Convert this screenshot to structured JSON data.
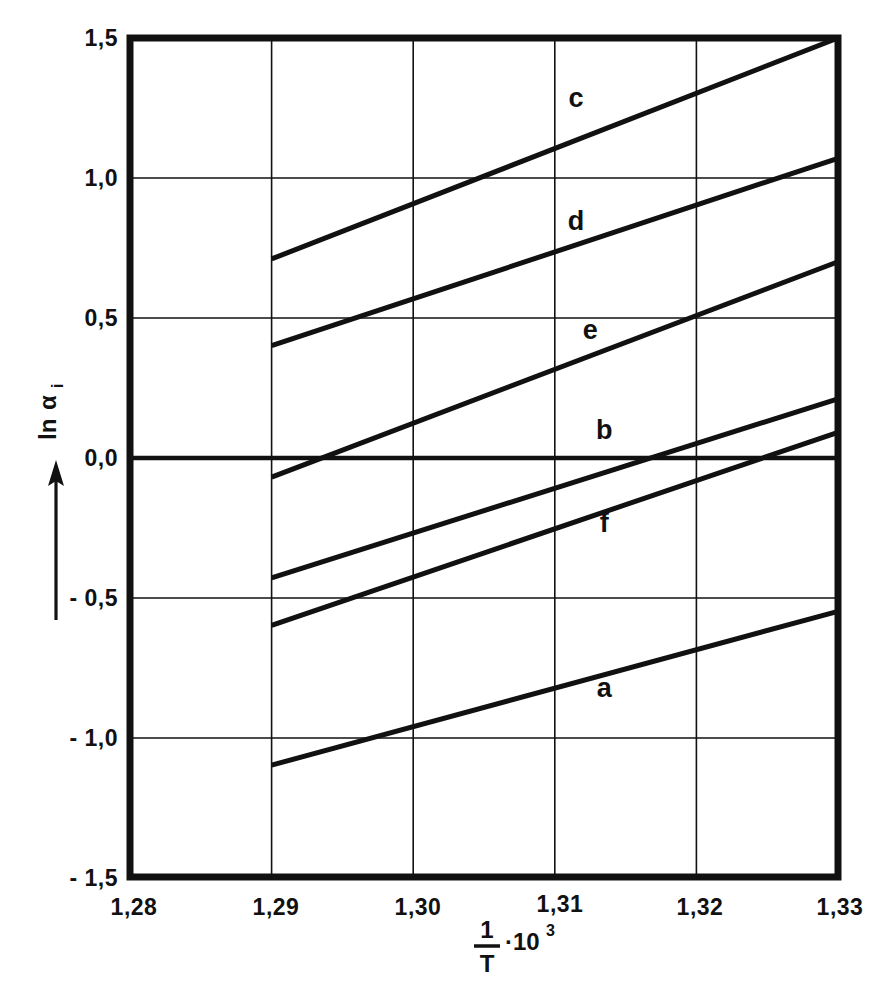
{
  "chart_data": {
    "type": "line",
    "title": "",
    "subtitle": "",
    "xlabel": "1/T · 10³",
    "xlabel_parts": {
      "numerator": "1",
      "denominator": "T",
      "multiplier": "·10",
      "exponent": "3"
    },
    "ylabel": "ln α i",
    "ylabel_parts": {
      "prefix": "ln",
      "symbol": "α",
      "subscript": "i"
    },
    "xlim": [
      1.28,
      1.33
    ],
    "ylim": [
      -1.5,
      1.5
    ],
    "x_ticks": [
      1.28,
      1.29,
      1.3,
      1.31,
      1.32,
      1.33
    ],
    "x_tick_labels": [
      "1,28",
      "1,29",
      "1,30",
      "1,31",
      "1,32",
      "1,33"
    ],
    "y_ticks": [
      1.5,
      1.0,
      0.5,
      0.0,
      -0.5,
      -1.0,
      -1.5
    ],
    "y_tick_labels": [
      "1,5",
      "1,0",
      "0,5",
      "0,0",
      "- 0,5",
      "- 1,0",
      "- 1,5"
    ],
    "grid": true,
    "emphasized_gridline_y": 0.0,
    "legend_position": "inline-labels",
    "line_color": "#111111",
    "background_color": "#ffffff",
    "series": [
      {
        "name": "c",
        "label": "c",
        "x": [
          1.29,
          1.33
        ],
        "values": [
          0.71,
          1.5
        ],
        "label_x": 1.3115,
        "label_y": 1.255
      },
      {
        "name": "d",
        "label": "d",
        "x": [
          1.29,
          1.33
        ],
        "values": [
          0.4,
          1.07
        ],
        "label_x": 1.3115,
        "label_y": 0.815
      },
      {
        "name": "e",
        "label": "e",
        "x": [
          1.29,
          1.33
        ],
        "values": [
          -0.07,
          0.7
        ],
        "label_x": 1.3125,
        "label_y": 0.425
      },
      {
        "name": "b",
        "label": "b",
        "x": [
          1.29,
          1.33
        ],
        "values": [
          -0.43,
          0.21
        ],
        "label_x": 1.3135,
        "label_y": 0.065
      },
      {
        "name": "f",
        "label": "f",
        "x": [
          1.29,
          1.33
        ],
        "values": [
          -0.6,
          0.09
        ],
        "label_x": 1.3135,
        "label_y": -0.265
      },
      {
        "name": "a",
        "label": "a",
        "x": [
          1.29,
          1.33
        ],
        "values": [
          -1.1,
          -0.55
        ],
        "label_x": 1.3135,
        "label_y": -0.855
      }
    ]
  }
}
